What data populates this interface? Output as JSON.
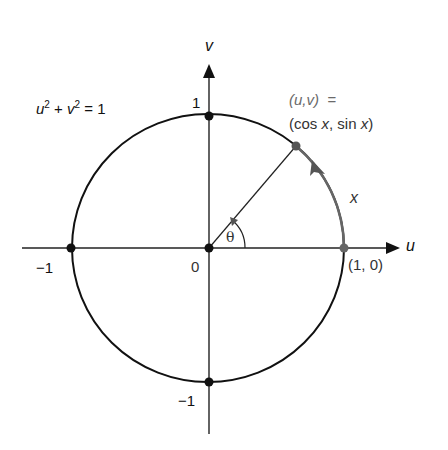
{
  "figure": {
    "axes": {
      "horizontal_label": "u",
      "vertical_label": "v",
      "origin_label": "0",
      "tick_labels": {
        "top": "1",
        "bottom": "−1",
        "left": "−1",
        "right": "(1, 0)"
      }
    },
    "equation": {
      "u": "u",
      "u_exp": "2",
      "plus": " + ",
      "v": "v",
      "v_exp": "2",
      "rhs": " = 1"
    },
    "point_label": {
      "line1": "(u,v)  =",
      "line2_open": "(cos ",
      "line2_x1": "x",
      "line2_mid": ", sin ",
      "line2_x2": "x",
      "line2_close": ")"
    },
    "arc_label": "x",
    "angle_label": "θ",
    "colors": {
      "ink": "#111111",
      "arc_gray": "#666666",
      "background": "#ffffff"
    }
  }
}
